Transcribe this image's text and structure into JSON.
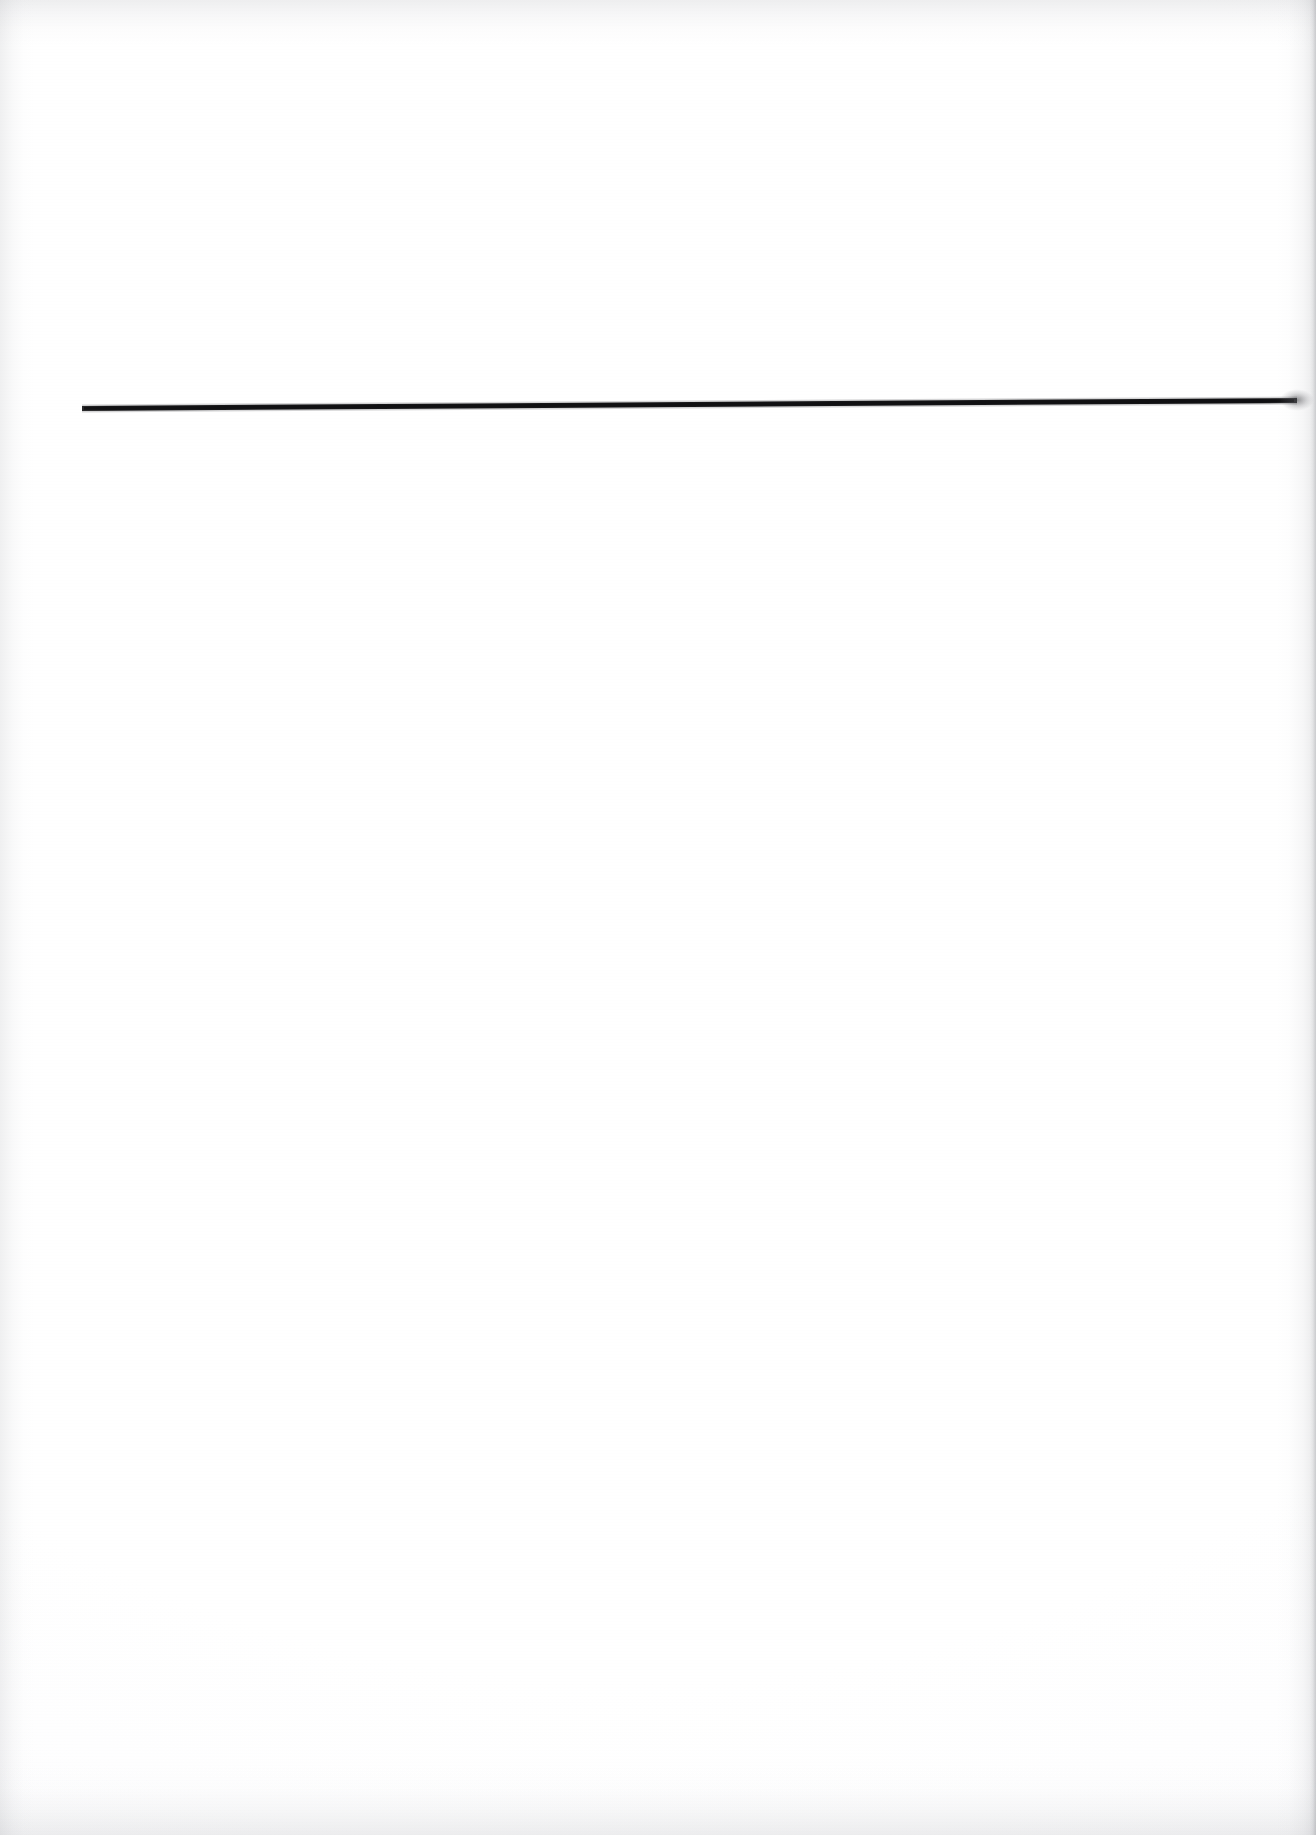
{
  "document": {
    "kind": "scanned-page",
    "page_width": 1316,
    "page_height": 1835,
    "background_color": "#ffffff",
    "visible_text": "",
    "caption": ""
  },
  "rule": {
    "label": "horizontal-rule",
    "color": "#1a1a1c",
    "x_start": 82,
    "y_start": 408,
    "x_end": 1297,
    "y_end": 400,
    "thickness": 5
  },
  "artifacts": {
    "bleed_through_ghost": "",
    "edge_shadow_color": "#96989e",
    "top_edge_height": 46,
    "bottom_edge_height": 70,
    "left_edge_width": 34,
    "right_edge_width": 40
  }
}
